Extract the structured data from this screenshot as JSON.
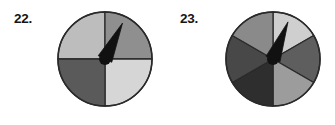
{
  "page": {
    "background_color": "#ffffff",
    "width": 335,
    "height": 125
  },
  "problems": [
    {
      "number_label": "22.",
      "spinner": {
        "name": "four-sector-spinner",
        "sector_count": 4,
        "center": {
          "x": 50,
          "y": 50
        },
        "radius": 47,
        "outline_color": "#2a2a2a",
        "outline_width": 1.6,
        "pointer": {
          "angle_degrees": 296,
          "length": 40,
          "color": "#111111",
          "hub_radius": 6,
          "hub_color": "#111111"
        },
        "sectors": [
          {
            "label": "top-left",
            "start_degrees": 180,
            "end_degrees": 270,
            "fill": "#bdbdbd"
          },
          {
            "label": "top-right",
            "start_degrees": 270,
            "end_degrees": 360,
            "fill": "#8f8f8f"
          },
          {
            "label": "bottom-right",
            "start_degrees": 0,
            "end_degrees": 90,
            "fill": "#d6d6d6"
          },
          {
            "label": "bottom-left",
            "start_degrees": 90,
            "end_degrees": 180,
            "fill": "#5a5a5a"
          }
        ]
      }
    },
    {
      "number_label": "23.",
      "spinner": {
        "name": "six-sector-spinner",
        "sector_count": 6,
        "center": {
          "x": 50,
          "y": 50
        },
        "radius": 47,
        "outline_color": "#2a2a2a",
        "outline_width": 1.6,
        "pointer": {
          "angle_degrees": 292,
          "length": 40,
          "color": "#111111",
          "hub_radius": 6,
          "hub_color": "#111111"
        },
        "sectors": [
          {
            "label": "top-right",
            "start_degrees": 270,
            "end_degrees": 330,
            "fill": "#cfcfcf"
          },
          {
            "label": "right",
            "start_degrees": 330,
            "end_degrees": 30,
            "fill": "#5e5e5e"
          },
          {
            "label": "bottom-right",
            "start_degrees": 30,
            "end_degrees": 90,
            "fill": "#9c9c9c"
          },
          {
            "label": "bottom-left",
            "start_degrees": 90,
            "end_degrees": 150,
            "fill": "#2e2e2e"
          },
          {
            "label": "left",
            "start_degrees": 150,
            "end_degrees": 210,
            "fill": "#484848"
          },
          {
            "label": "top-left",
            "start_degrees": 210,
            "end_degrees": 270,
            "fill": "#8a8a8a"
          }
        ]
      }
    }
  ]
}
